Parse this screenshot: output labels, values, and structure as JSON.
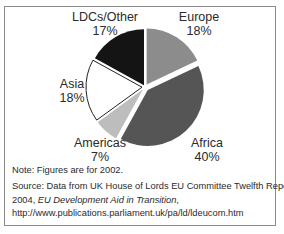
{
  "chart_data": {
    "type": "pie",
    "title": "",
    "categories": [
      "Europe",
      "Africa",
      "Americas",
      "Asia",
      "LDCs/Other"
    ],
    "values": [
      18,
      40,
      7,
      18,
      17
    ],
    "unit": "%",
    "start_angle": "12 o'clock",
    "direction": "clockwise",
    "colors": [
      "#8c8c8c",
      "#555555",
      "#bdbdbd",
      "#ffffff",
      "#141414"
    ],
    "exploded": true,
    "legend": "none (direct labels)",
    "labels": [
      {
        "name": "Europe",
        "pct": "18%"
      },
      {
        "name": "Africa",
        "pct": "40%"
      },
      {
        "name": "Americas",
        "pct": "7%"
      },
      {
        "name": "Asia",
        "pct": "18%"
      },
      {
        "name": "LDCs/Other",
        "pct": "17%"
      }
    ]
  },
  "labels": {
    "europe": {
      "name": "Europe",
      "pct": "18%"
    },
    "africa": {
      "name": "Africa",
      "pct": "40%"
    },
    "americas": {
      "name": "Americas",
      "pct": "7%"
    },
    "asia": {
      "name": "Asia",
      "pct": "18%"
    },
    "ldcs": {
      "name": "LDCs/Other",
      "pct": "17%"
    }
  },
  "note": "Note:  Figures are for 2002.",
  "source": {
    "line1": "Source:  Data from UK House of Lords EU Committee Twelfth Report",
    "line2_prefix": "2004, ",
    "line2_italic": "EU Development Aid in Transition",
    "line2_suffix": ",",
    "line3": "http://www.publications.parliament.uk/pa/ld/ldeucom.htm"
  }
}
